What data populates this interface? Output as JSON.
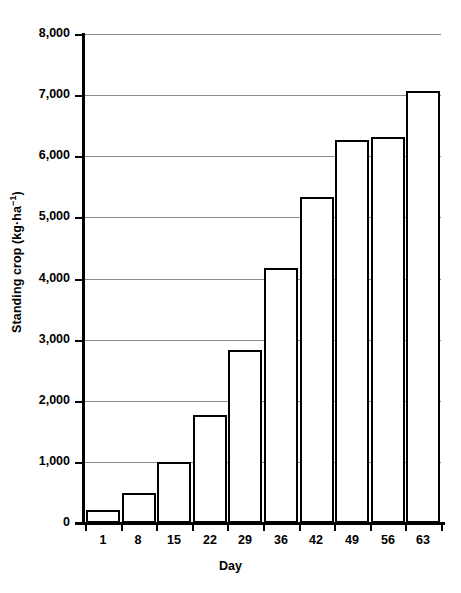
{
  "chart_data": {
    "type": "bar",
    "title": "",
    "subtitle": "",
    "xlabel": "Day",
    "ylabel": "Standing crop (kg·ha−1)",
    "ylabel_text": "Standing crop (kg·ha",
    "ylabel_exponent": "−1",
    "ylabel_close": ")",
    "categories": [
      "1",
      "8",
      "15",
      "22",
      "29",
      "36",
      "42",
      "49",
      "56",
      "63"
    ],
    "values": [
      210,
      490,
      1000,
      1760,
      2830,
      4170,
      5330,
      6270,
      6320,
      7070
    ],
    "series": [
      {
        "name": "Standing crop",
        "values": [
          210,
          490,
          1000,
          1760,
          2830,
          4170,
          5330,
          6270,
          6320,
          7070
        ]
      }
    ],
    "ylim": [
      0,
      8000
    ],
    "ytick_values": [
      0,
      1000,
      2000,
      3000,
      4000,
      5000,
      6000,
      7000,
      8000
    ],
    "ytick_labels": [
      "0",
      "1,000",
      "2,000",
      "3,000",
      "4,000",
      "5,000",
      "6,000",
      "7,000",
      "8,000"
    ],
    "grid": true,
    "grid_axis": "y",
    "legend": false,
    "legend_position": "none",
    "bar_fill_color": "#ffffff",
    "bar_edge_color": "#000000",
    "gridline_color": "#8a8a8a",
    "axis_color": "#000000",
    "background_color": "#ffffff"
  }
}
